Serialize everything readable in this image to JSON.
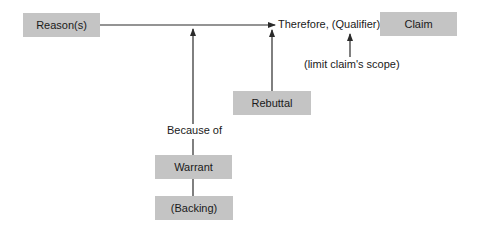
{
  "diagram": {
    "nodes": {
      "reasons": "Reason(s)",
      "claim": "Claim",
      "rebuttal": "Rebuttal",
      "warrant": "Warrant",
      "backing": "(Backing)"
    },
    "labels": {
      "qualifier": "Therefore, (Qualifier)",
      "qualifier_note": "(limit claim's scope)",
      "because_of": "Because of"
    },
    "edges": [
      {
        "from": "reasons",
        "to": "qualifier",
        "type": "arrow"
      },
      {
        "from": "warrant",
        "to": "reasons-qualifier-line",
        "type": "arrow",
        "via": "because_of"
      },
      {
        "from": "rebuttal",
        "to": "qualifier",
        "type": "arrow"
      },
      {
        "from": "qualifier_note",
        "to": "qualifier",
        "type": "arrow"
      },
      {
        "from": "backing",
        "to": "warrant",
        "type": "line"
      }
    ],
    "colors": {
      "box_fill": "#c4c4c4",
      "line": "#2a2a2a",
      "text": "#1a1a1a"
    }
  }
}
